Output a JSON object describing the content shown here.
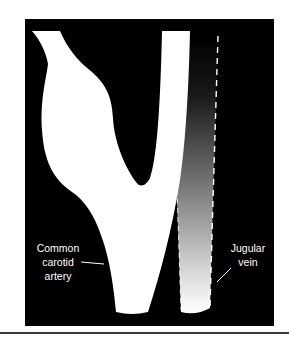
{
  "figure": {
    "background_color": "#000000",
    "vessel_color": "#ffffff",
    "vein_gradient": {
      "top_color": "#000000",
      "bottom_color": "#ffffff"
    },
    "labels": {
      "common_carotid_artery": {
        "lines": [
          "Common",
          "carotid",
          "artery"
        ]
      },
      "jugular_vein": {
        "lines": [
          "Jugular",
          "vein"
        ]
      }
    }
  }
}
